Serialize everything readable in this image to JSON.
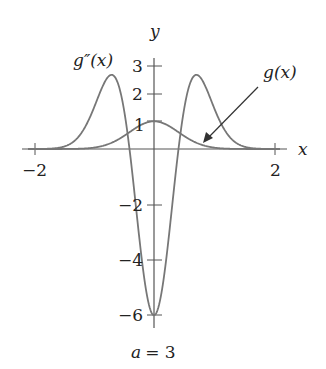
{
  "chart_data": {
    "type": "line",
    "title": "",
    "caption": "a = 3",
    "xlabel": "x",
    "ylabel": "y",
    "xlim": [
      -2,
      2
    ],
    "ylim": [
      -6,
      3
    ],
    "x_ticks": [
      -2,
      2
    ],
    "y_ticks": [
      3,
      2,
      1,
      -2,
      -4,
      -6
    ],
    "x_tick_labels": [
      "−2",
      "2"
    ],
    "y_tick_labels": [
      "3",
      "2",
      "1",
      "−2",
      "−4",
      "−6"
    ],
    "grid": false,
    "legend": "none",
    "series": [
      {
        "name": "g(x)",
        "formula": "exp(-3x^2)",
        "x": [
          -2,
          -1.5,
          -1,
          -0.75,
          -0.5,
          -0.25,
          0,
          0.25,
          0.5,
          0.75,
          1,
          1.5,
          2
        ],
        "values": [
          0.0,
          0.001,
          0.05,
          0.185,
          0.472,
          0.829,
          1.0,
          0.829,
          0.472,
          0.185,
          0.05,
          0.001,
          0.0
        ]
      },
      {
        "name": "g''(x)",
        "formula": "(36x^2-6)exp(-3x^2)",
        "x": [
          -2,
          -1.5,
          -1,
          -0.71,
          -0.5,
          -0.25,
          0,
          0.25,
          0.5,
          0.71,
          1,
          1.5,
          2
        ],
        "values": [
          0.0,
          0.08,
          1.49,
          2.68,
          0.47,
          -3.11,
          -6.0,
          -3.11,
          0.47,
          2.68,
          1.49,
          0.08,
          0.0
        ]
      }
    ],
    "annotations": [
      {
        "text": "g''(x)",
        "target": "g''(x) left peak"
      },
      {
        "text": "g(x)",
        "target": "g(x) curve",
        "arrow": true
      }
    ]
  },
  "labels": {
    "x_axis": "x",
    "y_axis": "y",
    "gpp": "g″(x)",
    "g": "g(x)",
    "caption": "a = 3",
    "t_xm2": "−2",
    "t_x2": "2",
    "t_y3": "3",
    "t_y2": "2",
    "t_y1": "1",
    "t_ym2": "−2",
    "t_ym4": "−4",
    "t_ym6": "−6"
  }
}
